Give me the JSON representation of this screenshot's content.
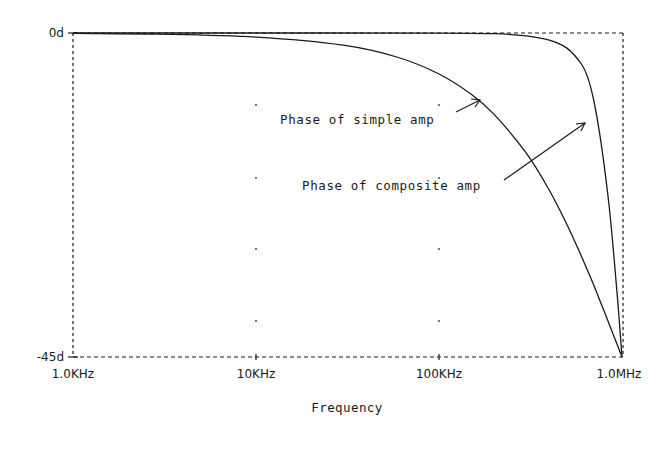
{
  "chart_data": {
    "type": "line",
    "title": "",
    "xlabel": "Frequency",
    "ylabel": "",
    "x_scale": "log",
    "xlim": [
      1000,
      1000000
    ],
    "ylim": [
      -45,
      0
    ],
    "x_tick_labels": [
      "1.0KHz",
      "10KHz",
      "100KHz",
      "1.0MHz"
    ],
    "x_tick_values": [
      1000,
      10000,
      100000,
      1000000
    ],
    "y_tick_labels": [
      "0d",
      "-45d"
    ],
    "y_tick_values": [
      0,
      -45
    ],
    "grid": "dotted-points",
    "frame": "dashed",
    "series": [
      {
        "name": "Phase of simple amp",
        "x": [
          1000,
          3000,
          10000,
          30000,
          60000,
          100000,
          150000,
          200000,
          300000,
          400000,
          500000,
          600000,
          700000,
          800000,
          900000,
          1000000
        ],
        "values": [
          -0.06,
          -0.17,
          -0.57,
          -1.7,
          -3.4,
          -5.7,
          -8.5,
          -11.3,
          -16.7,
          -21.8,
          -26.6,
          -31.0,
          -35.0,
          -38.7,
          -42.0,
          -45.0
        ]
      },
      {
        "name": "Phase of composite amp",
        "x": [
          1000,
          10000,
          100000,
          200000,
          300000,
          400000,
          500000,
          600000,
          650000,
          700000,
          750000,
          800000,
          850000,
          900000,
          950000,
          1000000
        ],
        "values": [
          0.0,
          0.0,
          -0.01,
          -0.1,
          -0.4,
          -1.0,
          -2.1,
          -4.3,
          -6.2,
          -9.3,
          -13.5,
          -18.5,
          -24.0,
          -30.5,
          -37.5,
          -45.0
        ]
      }
    ],
    "annotations": [
      {
        "text": "Phase of simple amp",
        "arrow_to_series": "Phase of simple amp",
        "arrow_target": [
          167000,
          -9.5
        ]
      },
      {
        "text": "Phase of composite amp",
        "arrow_to_series": "Phase of composite amp",
        "arrow_target": [
          680000,
          -12.5
        ]
      }
    ]
  },
  "labels": {
    "y_top": "0d",
    "y_bottom": "-45d",
    "x0": "1.0KHz",
    "x1": "10KHz",
    "x2": "100KHz",
    "x3": "1.0MHz",
    "x_axis_title": "Frequency",
    "annot_simple": "Phase of simple amp",
    "annot_composite": "Phase of composite amp"
  },
  "colors": {
    "ink": "#1a1a1a",
    "background": "#ffffff"
  }
}
